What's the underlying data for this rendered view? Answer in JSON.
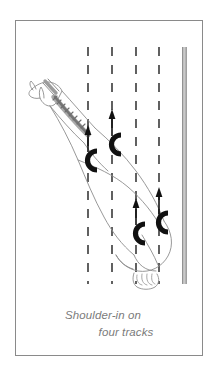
{
  "figure": {
    "title_lines": [
      "Shoulder-in on",
      "four tracks"
    ],
    "caption_line_1": "Shoulder-in on",
    "caption_line_2": "four tracks",
    "frame_color": "#8a8a8a",
    "background_color": "#ffffff",
    "caption_color": "#7b7b7b"
  },
  "arena": {
    "wall": {
      "label": "arena-wall",
      "color": "#9a9a9a",
      "x": 168,
      "y_top": 26,
      "y_bottom": 263
    },
    "track_lines": [
      {
        "label": "track-line-1",
        "x": 72,
        "y_top": 26,
        "y_bottom": 263,
        "style": "dashed",
        "color": "#3a3a3a"
      },
      {
        "label": "track-line-2",
        "x": 96,
        "y_top": 26,
        "y_bottom": 263,
        "style": "dashed",
        "color": "#3a3a3a"
      },
      {
        "label": "track-line-3",
        "x": 120,
        "y_top": 26,
        "y_bottom": 263,
        "style": "dashed",
        "color": "#3a3a3a"
      },
      {
        "label": "track-line-4",
        "x": 143,
        "y_top": 26,
        "y_bottom": 263,
        "style": "dashed",
        "color": "#3a3a3a"
      }
    ],
    "track_count": 4
  },
  "horse": {
    "label": "horse-outline",
    "outline_color": "#8d8d8d",
    "mane_color": "#6b6b6b",
    "orientation": "diagonal, head upper-left, hindquarters lower-right",
    "parts": [
      {
        "name": "head"
      },
      {
        "name": "noseband"
      },
      {
        "name": "neck"
      },
      {
        "name": "mane"
      },
      {
        "name": "body"
      },
      {
        "name": "hindquarters"
      },
      {
        "name": "tail"
      }
    ]
  },
  "hoofprints": [
    {
      "label": "hoofprint-left-fore",
      "x": 77,
      "y": 136,
      "arrow": true,
      "arrow_direction": "up"
    },
    {
      "label": "hoofprint-right-fore",
      "x": 101,
      "y": 120,
      "arrow": true,
      "arrow_direction": "up"
    },
    {
      "label": "hoofprint-left-hind",
      "x": 120,
      "y": 209,
      "arrow": true,
      "arrow_direction": "up"
    },
    {
      "label": "hoofprint-right-hind",
      "x": 144,
      "y": 198,
      "arrow": true,
      "arrow_direction": "up"
    }
  ],
  "colors": {
    "ink": "#1a1a1a",
    "line_gray": "#8d8d8d",
    "wall_gray": "#9a9a9a",
    "text_gray": "#7b7b7b"
  }
}
